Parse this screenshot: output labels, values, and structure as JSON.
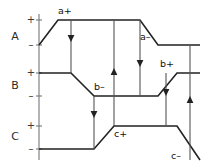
{
  "diagram": {
    "width": 207,
    "height": 166,
    "background_color": "#ffffff",
    "trace_color": "#222222",
    "axis_color": "#8c8c8c",
    "arrow_color": "#555555",
    "axes": [
      {
        "name": "A",
        "label_x": 15,
        "label_y": 37,
        "plus_label": "+",
        "plus_x": 31,
        "plus_y": 20,
        "minus_label": "–",
        "minus_x": 31,
        "minus_y": 45,
        "high_y": 20,
        "low_y": 45
      },
      {
        "name": "B",
        "label_x": 15,
        "label_y": 86,
        "plus_label": "+",
        "plus_x": 31,
        "plus_y": 73,
        "minus_label": "–",
        "minus_x": 31,
        "minus_y": 96,
        "high_y": 73,
        "low_y": 96
      },
      {
        "name": "C",
        "label_x": 15,
        "label_y": 137,
        "plus_label": "+",
        "plus_x": 31,
        "plus_y": 126,
        "minus_label": "–",
        "minus_x": 31,
        "minus_y": 149,
        "high_y": 126,
        "low_y": 149
      }
    ],
    "vertical_axis": {
      "x": 39,
      "y_top": 14,
      "y_bottom": 160
    },
    "ticks": [
      {
        "y": 20,
        "x1": 36,
        "x2": 42
      },
      {
        "y": 45,
        "x1": 36,
        "x2": 42
      },
      {
        "y": 73,
        "x1": 36,
        "x2": 42
      },
      {
        "y": 96,
        "x1": 36,
        "x2": 42
      },
      {
        "y": 126,
        "x1": 36,
        "x2": 42
      },
      {
        "y": 149,
        "x1": 36,
        "x2": 42
      }
    ],
    "traces": [
      {
        "signal": "A",
        "points": "39,45 58,20 140,20 158,45 200,45"
      },
      {
        "signal": "B",
        "points": "39,73 71,73 94,96 158,96 177,73 200,73"
      },
      {
        "signal": "C",
        "points": "39,149 94,149 114,126 177,126 200,160"
      }
    ],
    "event_labels": [
      {
        "text": "a+",
        "x": 58,
        "y": 11
      },
      {
        "text": "a–",
        "x": 140,
        "y": 37
      },
      {
        "text": "b–",
        "x": 94,
        "y": 87
      },
      {
        "text": "b+",
        "x": 160,
        "y": 64
      },
      {
        "text": "c+",
        "x": 114,
        "y": 134
      },
      {
        "text": "c–",
        "x": 171,
        "y": 156
      }
    ],
    "arrows": [
      {
        "id": "a-plus-to-b-minus",
        "x": 71,
        "y_start": 20,
        "y_end": 73,
        "direction": "down",
        "head_y": 42
      },
      {
        "id": "b-minus-to-c-plus",
        "x": 94,
        "y_start": 96,
        "y_end": 149,
        "direction": "down",
        "head_y": 118
      },
      {
        "id": "c-plus-to-a-minus",
        "x": 114,
        "y_start": 126,
        "y_end": 20,
        "direction": "up",
        "head_y": 68
      },
      {
        "id": "a-minus-to-b-plus",
        "x": 140,
        "y_start": 20,
        "y_end": 96,
        "direction": "down",
        "head_y": 67
      },
      {
        "id": "b-plus-to-c-minus",
        "x": 166,
        "y_start": 73,
        "y_end": 126,
        "direction": "down",
        "head_y": 96
      },
      {
        "id": "c-minus-to-a-plus",
        "x": 190,
        "y_start": 160,
        "y_end": 45,
        "direction": "up",
        "head_y": 96
      }
    ]
  }
}
